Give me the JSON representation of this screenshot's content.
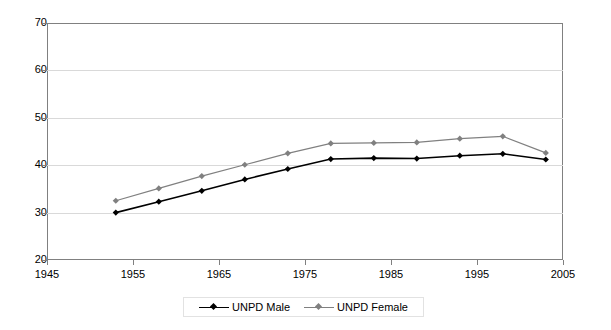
{
  "chart_data": {
    "type": "line",
    "title": "",
    "xlabel": "",
    "ylabel": "",
    "xlim": [
      1945,
      2005
    ],
    "ylim": [
      20,
      70
    ],
    "grid": true,
    "legend_position": "bottom",
    "xticks": [
      "1945",
      "1955",
      "1965",
      "1975",
      "1985",
      "1995",
      "2005"
    ],
    "yticks": [
      "20",
      "30",
      "40",
      "50",
      "60",
      "70"
    ],
    "x": [
      1953,
      1958,
      1963,
      1968,
      1973,
      1978,
      1983,
      1988,
      1993,
      1998,
      2003
    ],
    "series": [
      {
        "name": "UNPD Male",
        "color": "#000000",
        "marker": "diamond",
        "values": [
          30.0,
          32.3,
          34.6,
          37.0,
          39.2,
          41.3,
          41.5,
          41.4,
          42.0,
          42.4,
          41.2
        ]
      },
      {
        "name": "UNPD Female",
        "color": "#808080",
        "marker": "diamond",
        "values": [
          32.5,
          35.1,
          37.7,
          40.1,
          42.5,
          44.6,
          44.7,
          44.8,
          45.6,
          46.1,
          42.6
        ]
      }
    ]
  },
  "colors": {
    "male_line": "#000000",
    "female_line": "#808080",
    "gridline": "#d9d9d9",
    "axis": "#808080",
    "background": "#ffffff"
  },
  "legend": {
    "items": [
      {
        "label": "UNPD Male"
      },
      {
        "label": "UNPD Female"
      }
    ]
  }
}
